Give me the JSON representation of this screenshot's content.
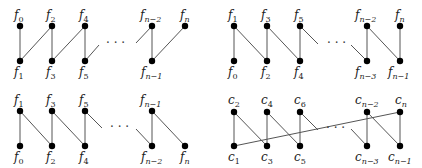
{
  "panels": [
    {
      "id": "top-left",
      "top_labels": [
        {
          "base": "f",
          "sub": "0"
        },
        {
          "base": "f",
          "sub": "2"
        },
        {
          "base": "f",
          "sub": "4"
        },
        {
          "base": "f",
          "sub": "n−2"
        },
        {
          "base": "f",
          "sub": "n"
        }
      ],
      "bottom_labels": [
        {
          "base": "f",
          "sub": "1"
        },
        {
          "base": "f",
          "sub": "3"
        },
        {
          "base": "f",
          "sub": "5"
        },
        {
          "base": "f",
          "sub": "n−1"
        }
      ],
      "ellipsis": "· · ·"
    },
    {
      "id": "top-right",
      "top_labels": [
        {
          "base": "f",
          "sub": "1"
        },
        {
          "base": "f",
          "sub": "3"
        },
        {
          "base": "f",
          "sub": "5"
        },
        {
          "base": "f",
          "sub": "n−2"
        },
        {
          "base": "f",
          "sub": "n"
        }
      ],
      "bottom_labels": [
        {
          "base": "f",
          "sub": "0"
        },
        {
          "base": "f",
          "sub": "2"
        },
        {
          "base": "f",
          "sub": "4"
        },
        {
          "base": "f",
          "sub": "n−3"
        },
        {
          "base": "f",
          "sub": "n−1"
        }
      ],
      "ellipsis": "· · ·"
    },
    {
      "id": "bottom-left",
      "top_labels": [
        {
          "base": "f",
          "sub": "1"
        },
        {
          "base": "f",
          "sub": "3"
        },
        {
          "base": "f",
          "sub": "5"
        },
        {
          "base": "f",
          "sub": "n−1"
        }
      ],
      "bottom_labels": [
        {
          "base": "f",
          "sub": "0"
        },
        {
          "base": "f",
          "sub": "2"
        },
        {
          "base": "f",
          "sub": "4"
        },
        {
          "base": "f",
          "sub": "n−2"
        },
        {
          "base": "f",
          "sub": "n"
        }
      ],
      "ellipsis": "· · ·"
    },
    {
      "id": "bottom-right",
      "top_labels": [
        {
          "base": "c",
          "sub": "2"
        },
        {
          "base": "c",
          "sub": "4"
        },
        {
          "base": "c",
          "sub": "6"
        },
        {
          "base": "c",
          "sub": "n−2"
        },
        {
          "base": "c",
          "sub": "n"
        }
      ],
      "bottom_labels": [
        {
          "base": "c",
          "sub": "1"
        },
        {
          "base": "c",
          "sub": "3"
        },
        {
          "base": "c",
          "sub": "5"
        },
        {
          "base": "c",
          "sub": "n−3"
        },
        {
          "base": "c",
          "sub": "n−1"
        }
      ],
      "ellipsis": "· · ·"
    }
  ]
}
